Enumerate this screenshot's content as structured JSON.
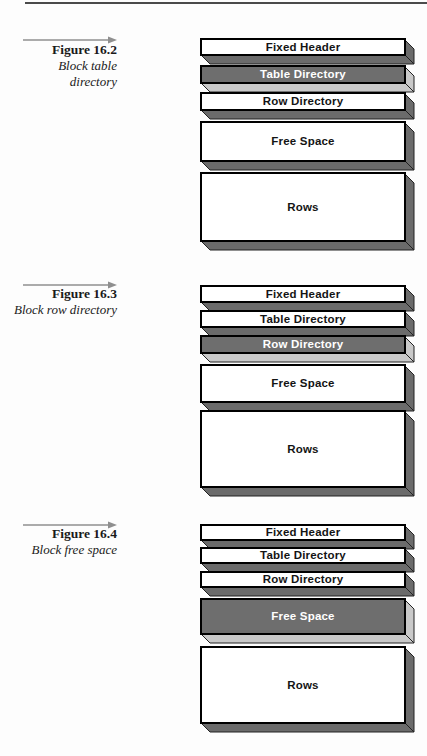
{
  "figures": [
    {
      "number": "Figure 16.2",
      "caption_lines": [
        "Block table",
        "directory"
      ],
      "blocks": [
        {
          "label": "Fixed Header",
          "highlighted": false
        },
        {
          "label": "Table Directory",
          "highlighted": true
        },
        {
          "label": "Row Directory",
          "highlighted": false
        },
        {
          "label": "Free Space",
          "highlighted": false
        },
        {
          "label": "Rows",
          "highlighted": false
        }
      ]
    },
    {
      "number": "Figure 16.3",
      "caption_lines": [
        "Block row directory"
      ],
      "blocks": [
        {
          "label": "Fixed Header",
          "highlighted": false
        },
        {
          "label": "Table Directory",
          "highlighted": false
        },
        {
          "label": "Row Directory",
          "highlighted": true
        },
        {
          "label": "Free Space",
          "highlighted": false
        },
        {
          "label": "Rows",
          "highlighted": false
        }
      ]
    },
    {
      "number": "Figure 16.4",
      "caption_lines": [
        "Block free space"
      ],
      "blocks": [
        {
          "label": "Fixed Header",
          "highlighted": false
        },
        {
          "label": "Table Directory",
          "highlighted": false
        },
        {
          "label": "Row Directory",
          "highlighted": false
        },
        {
          "label": "Free Space",
          "highlighted": true
        },
        {
          "label": "Rows",
          "highlighted": false
        }
      ]
    }
  ],
  "colors": {
    "block_face": "#ffffff",
    "block_face_highlight": "#6e6e6e",
    "bevel": "#6b6b6b",
    "bevel_highlight": "#c9c9c9",
    "page_rule": "#4b4b4b",
    "arrow": "#8f8f8f"
  }
}
